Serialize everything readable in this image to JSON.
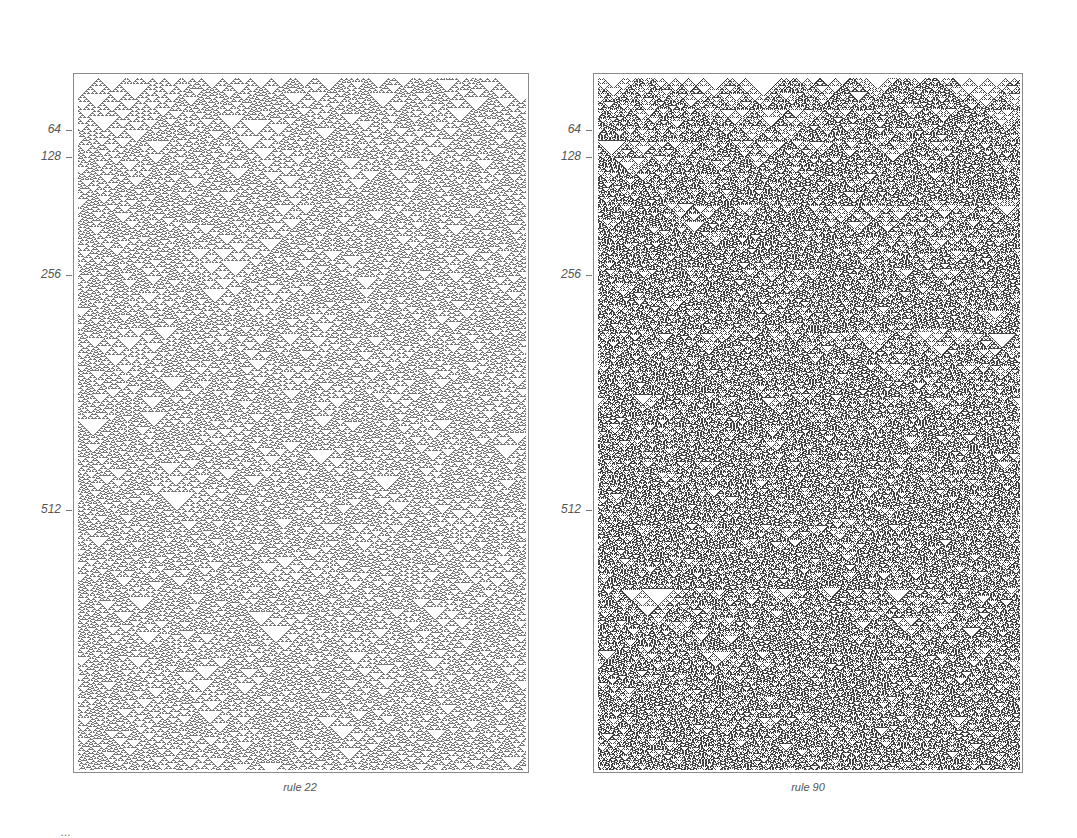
{
  "figure": {
    "panels": [
      {
        "id": "left",
        "rule": 22,
        "caption": "rule 22",
        "box": {
          "x": 73,
          "y": 73,
          "w": 456,
          "h": 700
        },
        "ticks": [
          {
            "label": "64",
            "y": 130
          },
          {
            "label": "128",
            "y": 157
          },
          {
            "label": "256",
            "y": 275
          },
          {
            "label": "512",
            "y": 510
          }
        ],
        "caption_pos": {
          "x": 200,
          "y": 781
        },
        "tone": "#777777"
      },
      {
        "id": "right",
        "rule": 90,
        "caption": "rule 90",
        "box": {
          "x": 593,
          "y": 73,
          "w": 430,
          "h": 700
        },
        "ticks": [
          {
            "label": "64",
            "y": 130
          },
          {
            "label": "128",
            "y": 157
          },
          {
            "label": "256",
            "y": 275
          },
          {
            "label": "512",
            "y": 510
          }
        ],
        "caption_pos": {
          "x": 708,
          "y": 781
        },
        "tone": "#555555"
      }
    ],
    "bottom_caption_fragment": "…"
  }
}
